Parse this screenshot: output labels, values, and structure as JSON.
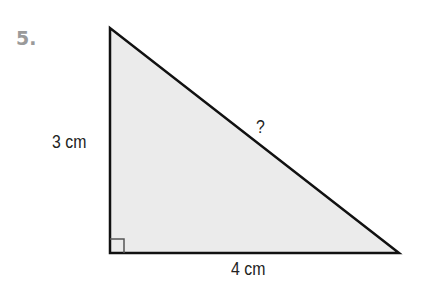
{
  "problem": {
    "number": "5.",
    "shape": "right triangle",
    "sides": {
      "vertical_leg": "3 cm",
      "horizontal_leg": "4 cm",
      "hypotenuse": "?"
    },
    "right_angle_marker": true,
    "colors": {
      "fill": "#ebebeb",
      "stroke": "#111111",
      "number": "#9a9a9a"
    }
  }
}
